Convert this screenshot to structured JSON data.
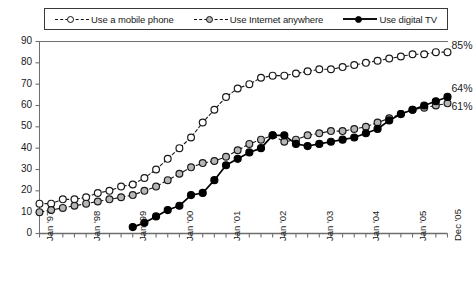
{
  "legend": {
    "items": [
      {
        "label": "Use a mobile phone",
        "marker": "hollow-circle-marker",
        "line": "dashed",
        "color": "#ffffff"
      },
      {
        "label": "Use Internet anywhere",
        "marker": "gray-circle-marker",
        "line": "dashed",
        "color": "#b6b6b6"
      },
      {
        "label": "Use digital TV",
        "marker": "filled-circle-marker",
        "line": "solid",
        "color": "#000000"
      }
    ]
  },
  "axis": {
    "y_ticks": [
      "90",
      "80",
      "70",
      "60",
      "50",
      "40",
      "30",
      "20",
      "10",
      "0"
    ],
    "x_ticks": [
      "Jan '97",
      "Jan '98",
      "Jan '99",
      "Jan '00",
      "Jan '01",
      "Jan '02",
      "Jan '03",
      "Jan '04",
      "Jan '05",
      "Dec '05"
    ]
  },
  "end_labels": [
    {
      "text": "85%",
      "series": "Use a mobile phone"
    },
    {
      "text": "64%",
      "series": "Use digital TV"
    },
    {
      "text": "61%",
      "series": "Use Internet anywhere"
    }
  ],
  "chart_data": {
    "type": "line",
    "title": "",
    "xlabel": "",
    "ylabel": "",
    "ylim": [
      0,
      90
    ],
    "grid": false,
    "legend_position": "top",
    "x": [
      "Jan '97",
      "Apr '97",
      "Jul '97",
      "Oct '97",
      "Jan '98",
      "Apr '98",
      "Jul '98",
      "Oct '98",
      "Jan '99",
      "Apr '99",
      "Jul '99",
      "Oct '99",
      "Jan '00",
      "Apr '00",
      "Jul '00",
      "Oct '00",
      "Jan '01",
      "Apr '01",
      "Jul '01",
      "Oct '01",
      "Jan '02",
      "Apr '02",
      "Jul '02",
      "Oct '02",
      "Jan '03",
      "Apr '03",
      "Jul '03",
      "Oct '03",
      "Jan '04",
      "Apr '04",
      "Jul '04",
      "Oct '04",
      "Jan '05",
      "Apr '05",
      "Jul '05",
      "Dec '05"
    ],
    "series": [
      {
        "name": "Use a mobile phone",
        "marker": "hollow-circle",
        "linestyle": "dashed",
        "values": [
          14,
          14,
          16,
          16,
          17,
          19,
          20,
          22,
          23,
          26,
          30,
          35,
          40,
          45,
          52,
          58,
          64,
          68,
          70,
          73,
          74,
          74,
          75,
          76,
          77,
          77,
          78,
          79,
          80,
          81,
          82,
          83,
          84,
          84,
          85,
          85
        ]
      },
      {
        "name": "Use Internet anywhere",
        "marker": "gray-circle",
        "linestyle": "dashed",
        "values": [
          10,
          11,
          12,
          13,
          14,
          15,
          16,
          17,
          18,
          20,
          22,
          25,
          28,
          31,
          33,
          34,
          36,
          39,
          42,
          44,
          46,
          43,
          44,
          46,
          47,
          48,
          48,
          49,
          50,
          52,
          54,
          56,
          58,
          59,
          60,
          61
        ]
      },
      {
        "name": "Use digital TV",
        "marker": "filled-circle",
        "linestyle": "solid",
        "values": [
          null,
          null,
          null,
          null,
          null,
          null,
          null,
          null,
          3,
          5,
          8,
          11,
          13,
          18,
          19,
          25,
          32,
          35,
          38,
          40,
          46,
          46,
          42,
          41,
          42,
          43,
          44,
          45,
          47,
          49,
          53,
          56,
          58,
          60,
          62,
          64
        ]
      }
    ]
  }
}
